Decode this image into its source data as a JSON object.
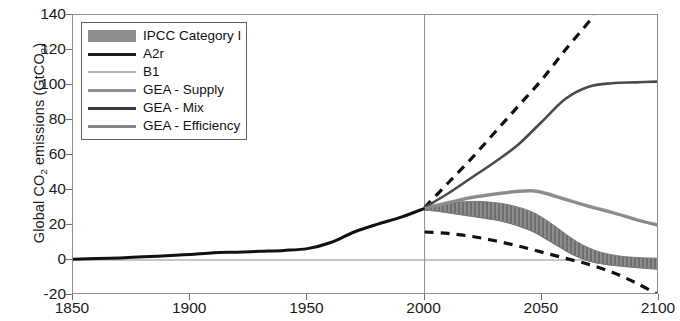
{
  "chart_data": {
    "type": "line",
    "title": "",
    "xlabel": "",
    "ylabel": "Global CO2 emissions (GtCO2)",
    "ylabel_rich": {
      "prefix": "Global CO",
      "sub1": "2",
      "mid": " emissions (GtCO",
      "sub2": "2",
      "suffix": ")"
    },
    "xlim": [
      1850,
      2100
    ],
    "ylim": [
      -20,
      140
    ],
    "xticks": [
      1850,
      1900,
      1950,
      2000,
      2050,
      2100
    ],
    "yticks": [
      -20,
      0,
      20,
      40,
      60,
      80,
      100,
      120,
      140
    ],
    "grid": "zero-line-and-2000-divider",
    "legend_position": "top-left-inside",
    "annotations": [
      {
        "name": "historical-projection-divider",
        "x": 2000,
        "type": "vertical-line"
      },
      {
        "name": "zero-line",
        "y": 0,
        "type": "horizontal-line"
      }
    ],
    "series": [
      {
        "name": "IPCC Category I",
        "key": "ipcc_band",
        "style": "filled-band",
        "color": "#8d8d8d",
        "x": [
          2000,
          2005,
          2010,
          2015,
          2020,
          2025,
          2030,
          2035,
          2040,
          2045,
          2050,
          2055,
          2060,
          2065,
          2070,
          2075,
          2080,
          2085,
          2090,
          2095,
          2100
        ],
        "upper": [
          30.5,
          31.5,
          32.5,
          33.2,
          33.5,
          33.4,
          32.8,
          31.8,
          30.2,
          28.0,
          24.5,
          20.0,
          15.0,
          10.5,
          7.0,
          4.5,
          3.0,
          2.0,
          1.5,
          1.2,
          1.0
        ],
        "lower": [
          28.5,
          28.0,
          27.0,
          26.0,
          25.0,
          24.0,
          23.0,
          21.5,
          19.5,
          17.0,
          13.5,
          9.5,
          5.5,
          2.0,
          -0.5,
          -2.0,
          -3.0,
          -3.6,
          -4.2,
          -4.8,
          -5.2
        ]
      },
      {
        "name": "A2r",
        "key": "a2r",
        "style": "dashed",
        "color": "#111111",
        "x": [
          2000,
          2010,
          2020,
          2030,
          2040,
          2050,
          2060,
          2070,
          2072
        ],
        "y": [
          30.0,
          44.0,
          58.0,
          73.0,
          88.0,
          103.0,
          120.0,
          136.0,
          140.0
        ]
      },
      {
        "name": "B1",
        "key": "b1",
        "style": "dashed",
        "color": "#111111",
        "x": [
          2000,
          2010,
          2020,
          2030,
          2040,
          2050,
          2060,
          2070,
          2080,
          2090,
          2100
        ],
        "y": [
          16.0,
          15.2,
          13.5,
          11.0,
          8.0,
          4.5,
          1.0,
          -2.5,
          -7.0,
          -13.0,
          -20.0
        ]
      },
      {
        "name": "GEA - Supply",
        "key": "gea_supply",
        "style": "solid",
        "color": "#9a9a9a",
        "x": [
          2000,
          2010,
          2020,
          2030,
          2040,
          2045,
          2050,
          2060,
          2070,
          2080,
          2090,
          2100
        ],
        "y": [
          30.0,
          33.0,
          36.0,
          38.0,
          39.5,
          39.8,
          39.0,
          35.0,
          31.0,
          27.5,
          23.5,
          20.0
        ]
      },
      {
        "name": "GEA - Mix",
        "key": "gea_mix",
        "style": "solid",
        "color": "#4a4a4a",
        "x": [
          2000,
          2010,
          2020,
          2030,
          2040,
          2050,
          2060,
          2070,
          2080,
          2090,
          2100
        ],
        "y": [
          30.0,
          38.0,
          47.0,
          56.0,
          66.0,
          79.0,
          92.0,
          99.0,
          101.0,
          101.5,
          102.0
        ]
      },
      {
        "name": "GEA - Efficiency",
        "key": "gea_efficiency",
        "style": "solid",
        "color": "#8a8a8a",
        "x": [
          2000,
          2010,
          2020,
          2030,
          2040,
          2045,
          2050,
          2060,
          2070,
          2080,
          2090,
          2100
        ],
        "y": [
          29.5,
          32.5,
          35.5,
          37.5,
          39.0,
          39.3,
          38.5,
          34.5,
          30.5,
          27.0,
          23.0,
          19.5
        ]
      },
      {
        "name": "Historical",
        "key": "historical",
        "style": "solid-thick",
        "color": "#111111",
        "x": [
          1850,
          1860,
          1870,
          1880,
          1890,
          1900,
          1910,
          1920,
          1930,
          1940,
          1950,
          1960,
          1970,
          1980,
          1990,
          2000
        ],
        "y": [
          0.5,
          0.8,
          1.2,
          1.8,
          2.4,
          3.2,
          4.2,
          4.5,
          5.0,
          5.5,
          6.5,
          10.0,
          16.0,
          20.5,
          24.5,
          29.5
        ]
      }
    ]
  },
  "axes": {
    "ytick_labels": [
      "140",
      "120",
      "100",
      "80",
      "60",
      "40",
      "20",
      "0",
      "-20"
    ],
    "xtick_labels": [
      "1850",
      "1900",
      "1950",
      "2000",
      "2050",
      "2100"
    ]
  },
  "legend": {
    "items": [
      {
        "label": "IPCC Category I",
        "key_style": "band",
        "color": "#8d8d8d"
      },
      {
        "label": "A2r",
        "key_style": "solid",
        "color": "#1d1d1d"
      },
      {
        "label": "B1",
        "key_style": "thin",
        "color": "#b0b0b0"
      },
      {
        "label": "GEA - Supply",
        "key_style": "solid",
        "color": "#8f8f8f"
      },
      {
        "label": "GEA - Mix",
        "key_style": "solid",
        "color": "#3a3a3a"
      },
      {
        "label": "GEA - Efficiency",
        "key_style": "solid",
        "color": "#858585"
      }
    ]
  }
}
